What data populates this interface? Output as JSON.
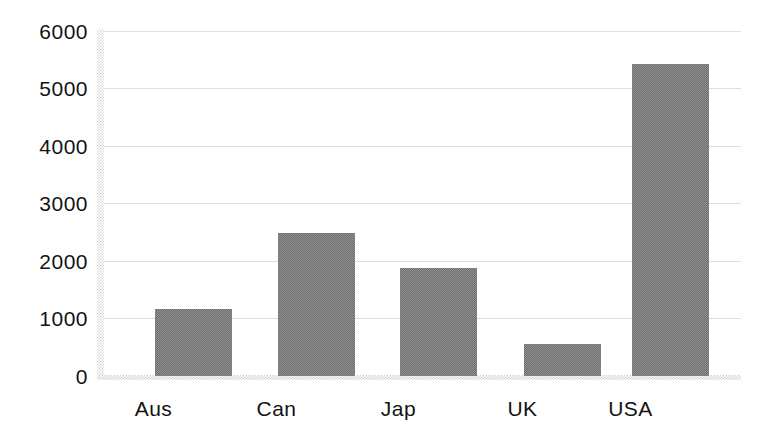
{
  "chart_data": {
    "type": "bar",
    "title": "",
    "subtitle": "",
    "xlabel": "",
    "ylabel": "",
    "categories": [
      "Aus",
      "Can",
      "Jap",
      "UK",
      "USA"
    ],
    "values": [
      1170,
      2490,
      1880,
      555,
      5420
    ],
    "series": [
      {
        "name": "",
        "values": [
          1170,
          2490,
          1880,
          555,
          5420
        ]
      }
    ],
    "ylim": [
      0,
      6000
    ],
    "yticks": [
      0,
      1000,
      2000,
      3000,
      4000,
      5000,
      6000
    ],
    "ytick_labels": [
      "0",
      "1000",
      "2000",
      "3000",
      "4000",
      "5000",
      "6000"
    ],
    "grid": true,
    "grid_axis": "y",
    "legend": false,
    "legend_position": "none",
    "annotations": [],
    "colors": {
      "bar_fill": "#8a8a8a",
      "bar_fill_light": "#919191",
      "bar_fill_dark": "#6e6e6e",
      "gridline": "#dedede",
      "axis": "#cfcfcf",
      "text": "#131313",
      "background": "#ffffff"
    }
  },
  "axis": {
    "y": {
      "ticks": [
        {
          "label": "6000",
          "value": 6000
        },
        {
          "label": "5000",
          "value": 5000
        },
        {
          "label": "4000",
          "value": 4000
        },
        {
          "label": "3000",
          "value": 3000
        },
        {
          "label": "2000",
          "value": 2000
        },
        {
          "label": "1000",
          "value": 1000
        },
        {
          "label": "0",
          "value": 0
        }
      ]
    },
    "x": {
      "ticks": [
        {
          "label": "Aus"
        },
        {
          "label": "Can"
        },
        {
          "label": "Jap"
        },
        {
          "label": "UK"
        },
        {
          "label": "USA"
        }
      ]
    }
  }
}
